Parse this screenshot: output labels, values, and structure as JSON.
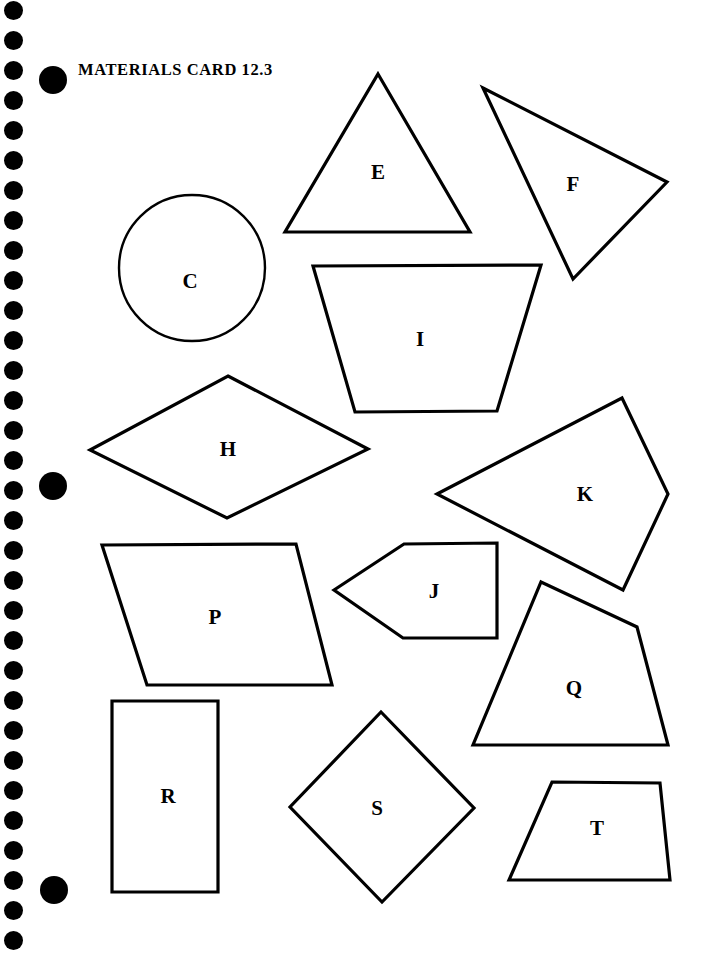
{
  "page": {
    "width": 713,
    "height": 956,
    "background_color": "#ffffff",
    "ink_color": "#000000"
  },
  "header": {
    "title": "MATERIALS CARD 12.3"
  },
  "binding": {
    "hole_color": "#000000",
    "hole_diameter": 19,
    "hole_spacing": 30,
    "hole_center_x": 13,
    "hole_first_center_y": 10,
    "hole_count": 32,
    "punch_dots": [
      {
        "name": "punch-dot-top",
        "cx": 53,
        "cy": 80,
        "d": 28
      },
      {
        "name": "punch-dot-middle",
        "cx": 53,
        "cy": 486,
        "d": 28
      },
      {
        "name": "punch-dot-bottom",
        "cx": 54,
        "cy": 890,
        "d": 28
      }
    ]
  },
  "shapes": [
    {
      "id": "C",
      "label": "C",
      "kind": "circle",
      "name": "shape-circle-c",
      "cx": 192,
      "cy": 268,
      "r": 73,
      "label_x": 190,
      "label_y": 281
    },
    {
      "id": "E",
      "label": "E",
      "kind": "triangle",
      "name": "shape-triangle-e",
      "points": "378,74 470,232 285,232",
      "label_x": 378,
      "label_y": 172
    },
    {
      "id": "F",
      "label": "F",
      "kind": "triangle",
      "name": "shape-triangle-f",
      "points": "483,88 667,182 573,279",
      "label_x": 573,
      "label_y": 184
    },
    {
      "id": "I",
      "label": "I",
      "kind": "trapezoid",
      "name": "shape-trapezoid-i",
      "points": "313,266 541,265 497,411 355,412",
      "label_x": 420,
      "label_y": 339
    },
    {
      "id": "H",
      "label": "H",
      "kind": "rhombus",
      "name": "shape-rhombus-h",
      "points": "228,376 368,449 227,518 90,450",
      "label_x": 228,
      "label_y": 449
    },
    {
      "id": "K",
      "label": "K",
      "kind": "quadrilateral",
      "name": "shape-quadrilateral-k",
      "points": "437,494 622,398 668,494 623,590",
      "label_x": 585,
      "label_y": 494
    },
    {
      "id": "J",
      "label": "J",
      "kind": "pentagon",
      "name": "shape-pentagon-j",
      "points": "334,590 404,544 497,543 497,638 403,638",
      "label_x": 434,
      "label_y": 591
    },
    {
      "id": "P",
      "label": "P",
      "kind": "parallelogram",
      "name": "shape-parallelogram-p",
      "points": "102,545 296,544 332,685 147,685",
      "label_x": 215,
      "label_y": 617
    },
    {
      "id": "Q",
      "label": "Q",
      "kind": "quadrilateral",
      "name": "shape-quadrilateral-q",
      "points": "541,582 637,627 668,745 473,745",
      "label_x": 574,
      "label_y": 688
    },
    {
      "id": "R",
      "label": "R",
      "kind": "rectangle",
      "name": "shape-rectangle-r",
      "points": "112,701 218,701 218,892 112,892",
      "label_x": 168,
      "label_y": 796
    },
    {
      "id": "S",
      "label": "S",
      "kind": "square-rotated",
      "name": "shape-square-s",
      "points": "381,712 474,808 382,902 290,807",
      "label_x": 377,
      "label_y": 808
    },
    {
      "id": "T",
      "label": "T",
      "kind": "trapezoid",
      "name": "shape-trapezoid-t",
      "points": "552,782 660,783 670,880 509,880",
      "label_x": 597,
      "label_y": 828
    }
  ]
}
